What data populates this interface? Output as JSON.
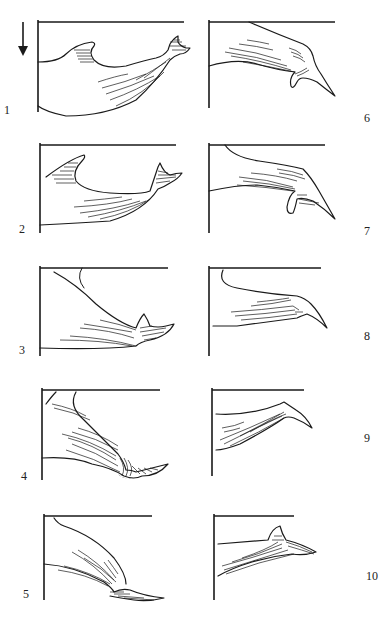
{
  "figure": {
    "direction_indicator": "arrow-down",
    "panels": [
      {
        "number": "1",
        "subject": "back and dorsal fin, flukes rising"
      },
      {
        "number": "2",
        "subject": "dorsal fin, flukes lifting"
      },
      {
        "number": "3",
        "subject": "body arching, flukes emerging"
      },
      {
        "number": "4",
        "subject": "steep arch, flukes twisting"
      },
      {
        "number": "5",
        "subject": "steep dive, flukes edge-on"
      },
      {
        "number": "6",
        "subject": "body curving, flukes pointed down"
      },
      {
        "number": "7",
        "subject": "flukes curving downward"
      },
      {
        "number": "8",
        "subject": "flukes trailing"
      },
      {
        "number": "9",
        "subject": "flukes thin edge"
      },
      {
        "number": "10",
        "subject": "flukes rising from water"
      }
    ]
  },
  "caption": {
    "text": ""
  }
}
